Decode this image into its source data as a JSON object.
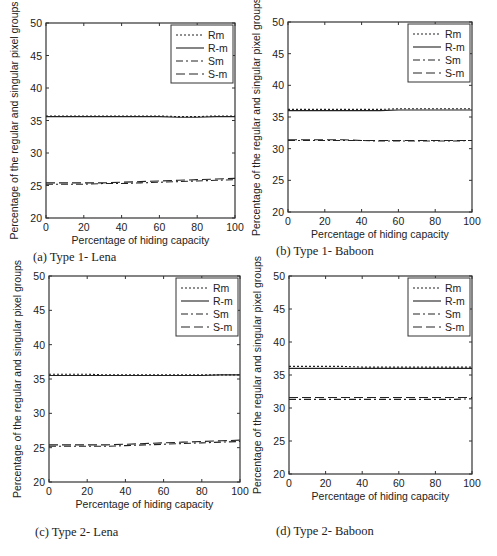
{
  "figure": {
    "panels": [
      {
        "id": "a",
        "caption": "(a)  Type 1- Lena"
      },
      {
        "id": "b",
        "caption": "(b)  Type 1- Baboon"
      },
      {
        "id": "c",
        "caption": "(c)  Type 2- Lena"
      },
      {
        "id": "d",
        "caption": "(d)  Type 2- Baboon"
      }
    ]
  },
  "chart_data": [
    {
      "type": "line",
      "panel": "a",
      "title": "(a) Type 1- Lena",
      "xlabel": "Percentage of hiding capacity",
      "ylabel": "Percentage of the regular and singular pixel groups",
      "xlim": [
        0,
        100
      ],
      "ylim": [
        20,
        50
      ],
      "xticks": [
        0,
        20,
        40,
        60,
        80,
        100
      ],
      "yticks": [
        20,
        25,
        30,
        35,
        40,
        45,
        50
      ],
      "grid": false,
      "legend_position": "upper right",
      "x": [
        0,
        10,
        20,
        30,
        40,
        50,
        60,
        70,
        80,
        90,
        100
      ],
      "series": [
        {
          "name": "Rm",
          "style": "dotted",
          "values": [
            35.7,
            35.7,
            35.7,
            35.7,
            35.7,
            35.7,
            35.7,
            35.6,
            35.6,
            35.7,
            35.7
          ]
        },
        {
          "name": "R-m",
          "style": "solid",
          "values": [
            35.6,
            35.6,
            35.6,
            35.6,
            35.6,
            35.6,
            35.6,
            35.5,
            35.5,
            35.6,
            35.6
          ]
        },
        {
          "name": "Sm",
          "style": "dashdot",
          "values": [
            25.2,
            25.2,
            25.2,
            25.3,
            25.3,
            25.4,
            25.5,
            25.6,
            25.7,
            25.8,
            25.9
          ]
        },
        {
          "name": "S-m",
          "style": "dashed",
          "values": [
            25.4,
            25.4,
            25.4,
            25.4,
            25.5,
            25.6,
            25.7,
            25.8,
            25.9,
            26.0,
            26.1
          ]
        }
      ]
    },
    {
      "type": "line",
      "panel": "b",
      "title": "(b) Type 1- Baboon",
      "xlabel": "Percentage of hiding capacity",
      "ylabel": "Percentage of the regular and singular pixel groups",
      "xlim": [
        0,
        100
      ],
      "ylim": [
        20,
        50
      ],
      "xticks": [
        0,
        20,
        40,
        60,
        80,
        100
      ],
      "yticks": [
        20,
        25,
        30,
        35,
        40,
        45,
        50
      ],
      "grid": false,
      "legend_position": "upper right",
      "x": [
        0,
        10,
        20,
        30,
        40,
        50,
        60,
        70,
        80,
        90,
        100
      ],
      "series": [
        {
          "name": "Rm",
          "style": "dotted",
          "values": [
            36.2,
            36.2,
            36.2,
            36.2,
            36.2,
            36.2,
            36.3,
            36.3,
            36.3,
            36.3,
            36.3
          ]
        },
        {
          "name": "R-m",
          "style": "solid",
          "values": [
            36.0,
            36.0,
            36.0,
            36.0,
            36.0,
            36.0,
            36.1,
            36.1,
            36.1,
            36.1,
            36.1
          ]
        },
        {
          "name": "Sm",
          "style": "dashdot",
          "values": [
            31.3,
            31.3,
            31.3,
            31.3,
            31.3,
            31.2,
            31.2,
            31.2,
            31.2,
            31.2,
            31.3
          ]
        },
        {
          "name": "S-m",
          "style": "dashed",
          "values": [
            31.4,
            31.4,
            31.4,
            31.4,
            31.3,
            31.3,
            31.3,
            31.3,
            31.3,
            31.3,
            31.3
          ]
        }
      ]
    },
    {
      "type": "line",
      "panel": "c",
      "title": "(c) Type 2- Lena",
      "xlabel": "Percentage of hiding capacity",
      "ylabel": "Percentage of the regular and singular pixel groups",
      "xlim": [
        0,
        100
      ],
      "ylim": [
        20,
        50
      ],
      "xticks": [
        0,
        20,
        40,
        60,
        80,
        100
      ],
      "yticks": [
        20,
        25,
        30,
        35,
        40,
        45,
        50
      ],
      "grid": false,
      "legend_position": "upper right",
      "x": [
        0,
        10,
        20,
        30,
        40,
        50,
        60,
        70,
        80,
        90,
        100
      ],
      "series": [
        {
          "name": "Rm",
          "style": "dotted",
          "values": [
            35.7,
            35.7,
            35.7,
            35.6,
            35.6,
            35.6,
            35.6,
            35.6,
            35.6,
            35.6,
            35.6
          ]
        },
        {
          "name": "R-m",
          "style": "solid",
          "values": [
            35.5,
            35.5,
            35.5,
            35.5,
            35.5,
            35.5,
            35.5,
            35.5,
            35.5,
            35.6,
            35.6
          ]
        },
        {
          "name": "Sm",
          "style": "dashdot",
          "values": [
            25.2,
            25.2,
            25.2,
            25.2,
            25.3,
            25.4,
            25.5,
            25.6,
            25.7,
            25.8,
            25.9
          ]
        },
        {
          "name": "S-m",
          "style": "dashed",
          "values": [
            25.4,
            25.4,
            25.4,
            25.4,
            25.5,
            25.6,
            25.7,
            25.8,
            25.9,
            26.0,
            26.1
          ]
        }
      ]
    },
    {
      "type": "line",
      "panel": "d",
      "title": "(d) Type 2- Baboon",
      "xlabel": "Percentage of hiding capacity",
      "ylabel": "Percentage of the regular and singular pixel groups",
      "xlim": [
        0,
        100
      ],
      "ylim": [
        20,
        50
      ],
      "xticks": [
        0,
        20,
        40,
        60,
        80,
        100
      ],
      "yticks": [
        20,
        25,
        30,
        35,
        40,
        45,
        50
      ],
      "grid": false,
      "legend_position": "upper right",
      "x": [
        0,
        10,
        20,
        30,
        40,
        50,
        60,
        70,
        80,
        90,
        100
      ],
      "series": [
        {
          "name": "Rm",
          "style": "dotted",
          "values": [
            36.3,
            36.3,
            36.3,
            36.3,
            36.2,
            36.2,
            36.2,
            36.2,
            36.2,
            36.2,
            36.2
          ]
        },
        {
          "name": "R-m",
          "style": "solid",
          "values": [
            36.0,
            36.0,
            36.0,
            36.0,
            36.0,
            36.0,
            36.0,
            36.0,
            36.0,
            36.0,
            36.0
          ]
        },
        {
          "name": "Sm",
          "style": "dashdot",
          "values": [
            31.3,
            31.3,
            31.3,
            31.3,
            31.3,
            31.3,
            31.3,
            31.3,
            31.3,
            31.3,
            31.4
          ]
        },
        {
          "name": "S-m",
          "style": "dashed",
          "values": [
            31.6,
            31.6,
            31.6,
            31.6,
            31.6,
            31.6,
            31.6,
            31.6,
            31.6,
            31.6,
            31.6
          ]
        }
      ]
    }
  ]
}
